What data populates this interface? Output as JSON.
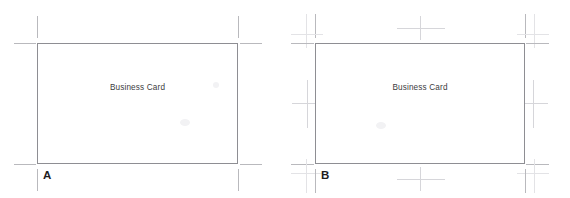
{
  "figure": {
    "background_color": "#ffffff",
    "panels": [
      {
        "id": "A",
        "letter": "A",
        "card_label": "Business Card",
        "mark_style": "single offset trim marks",
        "card_border_color": "#8e8e93",
        "mark_color": "#b9b9bd",
        "card": {
          "x": 37,
          "y": 43,
          "width": 201,
          "height": 121
        },
        "marks": {
          "type": "corner-trim",
          "offset": 6,
          "length": 18,
          "corners": [
            "top-left",
            "top-right",
            "bottom-left",
            "bottom-right"
          ]
        }
      },
      {
        "id": "B",
        "letter": "B",
        "card_label": "Business Card",
        "mark_style": "double crop marks with bleed and center registration marks",
        "card_border_color": "#8e8e93",
        "mark_color": "#b9b9bd",
        "card": {
          "x": 315,
          "y": 43,
          "width": 210,
          "height": 121
        },
        "marks": {
          "type": "corner-trim-plus-bleed-and-registration",
          "offset": 5,
          "length": 22,
          "corners": [
            "top-left",
            "top-right",
            "bottom-left",
            "bottom-right"
          ],
          "registration_marks": [
            "top-center",
            "bottom-center",
            "left-center",
            "right-center"
          ]
        }
      }
    ]
  },
  "colors": {
    "card_border": "#8e8e93",
    "mark": "#b9b9bd",
    "mark_faint": "#d6d6da",
    "mark_fainter": "#e3e3e6",
    "label_text": "#3c3c41",
    "letter_text": "#1d1d1f",
    "background": "#ffffff"
  }
}
